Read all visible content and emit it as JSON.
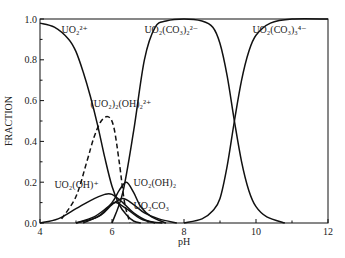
{
  "chart_data": {
    "type": "line",
    "title": "",
    "xlabel": "pH",
    "ylabel": "FRACTION",
    "xlim": [
      4,
      12
    ],
    "ylim": [
      0,
      1.0
    ],
    "xticks": [
      "4",
      "6",
      "8",
      "10",
      "12"
    ],
    "yticks": [
      "0.0",
      "0.2",
      "0.4",
      "0.6",
      "0.8",
      "1.0"
    ],
    "grid": false,
    "legend": "none (inline curve labels)",
    "series": [
      {
        "name": "UO2^2+",
        "label": "UO₂²⁺",
        "style": "solid",
        "x": [
          4.0,
          4.4,
          4.8,
          5.0,
          5.2,
          5.4,
          5.6,
          5.8,
          6.0,
          6.2,
          6.4,
          6.6,
          6.8
        ],
        "y": [
          0.98,
          0.96,
          0.9,
          0.84,
          0.74,
          0.62,
          0.48,
          0.32,
          0.18,
          0.09,
          0.04,
          0.01,
          0.0
        ]
      },
      {
        "name": "(UO2)2(OH)2^2+",
        "label": "(UO₂)₂(OH)₂²⁺",
        "style": "dashed",
        "x": [
          4.6,
          5.0,
          5.3,
          5.5,
          5.7,
          5.9,
          6.05,
          6.2,
          6.35,
          6.5
        ],
        "y": [
          0.02,
          0.13,
          0.3,
          0.42,
          0.5,
          0.52,
          0.47,
          0.3,
          0.1,
          0.0
        ]
      },
      {
        "name": "UO2(OH)+",
        "label": "UO₂(OH)⁺",
        "style": "solid",
        "x": [
          4.0,
          4.5,
          5.0,
          5.4,
          5.8,
          6.0,
          6.3,
          6.6,
          7.0,
          7.4
        ],
        "y": [
          0.0,
          0.02,
          0.07,
          0.11,
          0.14,
          0.14,
          0.1,
          0.05,
          0.01,
          0.0
        ]
      },
      {
        "name": "UO2(OH)2",
        "label": "UO₂(OH)₂",
        "style": "solid",
        "x": [
          5.0,
          5.6,
          6.0,
          6.2,
          6.4,
          6.6,
          6.8,
          7.1,
          7.5
        ],
        "y": [
          0.0,
          0.03,
          0.1,
          0.16,
          0.2,
          0.15,
          0.08,
          0.03,
          0.0
        ]
      },
      {
        "name": "UO2CO3",
        "label": "UO₂CO₃",
        "style": "solid",
        "x": [
          5.2,
          5.7,
          6.0,
          6.3,
          6.6,
          6.9,
          7.3,
          7.8
        ],
        "y": [
          0.0,
          0.04,
          0.09,
          0.12,
          0.09,
          0.05,
          0.02,
          0.0
        ]
      },
      {
        "name": "minor hydroxy-carbonate species",
        "label": "",
        "style": "solid",
        "x": [
          5.0,
          5.5,
          5.9,
          6.1,
          6.4,
          6.8,
          7.2
        ],
        "y": [
          0.0,
          0.03,
          0.08,
          0.1,
          0.07,
          0.02,
          0.0
        ]
      },
      {
        "name": "UO2(CO3)2^2-",
        "label": "UO₂(CO₃)₂²⁻",
        "style": "solid",
        "x": [
          6.0,
          6.3,
          6.6,
          6.9,
          7.2,
          7.5,
          8.0,
          8.5,
          8.8,
          9.0,
          9.2,
          9.4,
          9.6,
          9.8,
          10.0,
          10.3,
          10.8
        ],
        "y": [
          0.0,
          0.15,
          0.45,
          0.8,
          0.96,
          0.99,
          1.0,
          0.99,
          0.96,
          0.88,
          0.72,
          0.5,
          0.3,
          0.16,
          0.08,
          0.03,
          0.0
        ]
      },
      {
        "name": "UO2(CO3)3^4-",
        "label": "UO₂(CO₃)₃⁴⁻",
        "style": "solid",
        "x": [
          8.0,
          8.5,
          8.8,
          9.0,
          9.2,
          9.4,
          9.6,
          9.8,
          10.0,
          10.4,
          11.0,
          12.0
        ],
        "y": [
          0.0,
          0.02,
          0.06,
          0.12,
          0.28,
          0.5,
          0.7,
          0.84,
          0.92,
          0.98,
          1.0,
          1.0
        ]
      }
    ],
    "annotations": [
      {
        "text": "UO₂²⁺",
        "x": 4.6,
        "y": 0.93
      },
      {
        "text": "(UO₂)₂(OH)₂²⁺",
        "x": 5.4,
        "y": 0.57
      },
      {
        "text": "UO₂(OH)⁺",
        "x": 4.4,
        "y": 0.17
      },
      {
        "text": "UO₂(OH)₂",
        "x": 6.6,
        "y": 0.18
      },
      {
        "text": "UO₂CO₃",
        "x": 6.6,
        "y": 0.07
      },
      {
        "text": "UO₂(CO₃)₂²⁻",
        "x": 6.9,
        "y": 0.93
      },
      {
        "text": "UO₂(CO₃)₃⁴⁻",
        "x": 9.9,
        "y": 0.93
      }
    ]
  }
}
